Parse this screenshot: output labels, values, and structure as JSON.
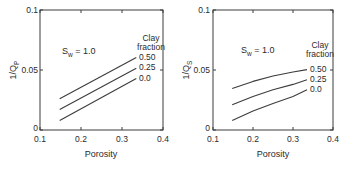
{
  "figure": {
    "background": "#ffffff",
    "line_color": "#3c3c3c",
    "text_color": "#2b2b2b"
  },
  "chart_data": [
    {
      "type": "line",
      "panel": "left",
      "xlabel": "Porosity",
      "ylabel_base": "1/Q",
      "ylabel_sub": "P",
      "annotation_base": "S",
      "annotation_sub": "w",
      "annotation_rest": " = 1.0",
      "legend_title_lines": [
        "Clay",
        "fraction"
      ],
      "legend_position": "inside-top-right",
      "grid": false,
      "xlim": [
        0.1,
        0.4
      ],
      "ylim": [
        0,
        0.1
      ],
      "x_ticks": [
        {
          "v": 0.1,
          "label": "0.1"
        },
        {
          "v": 0.2,
          "label": "0.2"
        },
        {
          "v": 0.3,
          "label": "0.3"
        },
        {
          "v": 0.4,
          "label": "0.4"
        }
      ],
      "y_ticks": [
        {
          "v": 0.1,
          "label": "0.1"
        },
        {
          "v": 0.05,
          "label": "0.05"
        },
        {
          "v": 0,
          "label": "0"
        }
      ],
      "series": [
        {
          "name": "clay-0.50",
          "label": "0.50",
          "x": [
            0.148,
            0.335
          ],
          "y": [
            0.026,
            0.0605
          ]
        },
        {
          "name": "clay-0.25",
          "label": "0.25",
          "x": [
            0.148,
            0.335
          ],
          "y": [
            0.017,
            0.0515
          ]
        },
        {
          "name": "clay-0.0",
          "label": "0.0",
          "x": [
            0.148,
            0.335
          ],
          "y": [
            0.008,
            0.0428
          ]
        }
      ]
    },
    {
      "type": "line",
      "panel": "right",
      "xlabel": "Porosity",
      "ylabel_base": "1/Q",
      "ylabel_sub": "S",
      "annotation_base": "S",
      "annotation_sub": "w",
      "annotation_rest": " = 1.0",
      "legend_title_lines": [
        "Clay",
        "fraction"
      ],
      "legend_position": "inside-top-right",
      "grid": false,
      "xlim": [
        0.1,
        0.4
      ],
      "ylim": [
        0,
        0.1
      ],
      "x_ticks": [
        {
          "v": 0.1,
          "label": "0.1"
        },
        {
          "v": 0.2,
          "label": "0.2"
        },
        {
          "v": 0.3,
          "label": "0.3"
        },
        {
          "v": 0.4,
          "label": "0.4"
        }
      ],
      "y_ticks": [
        {
          "v": 0.1,
          "label": "0.1"
        },
        {
          "v": 0.05,
          "label": "0.05"
        },
        {
          "v": 0,
          "label": "0"
        }
      ],
      "series": [
        {
          "name": "clay-0.50",
          "label": "0.50",
          "x": [
            0.148,
            0.2,
            0.25,
            0.3,
            0.335
          ],
          "y": [
            0.0345,
            0.0405,
            0.045,
            0.0483,
            0.0503
          ]
        },
        {
          "name": "clay-0.25",
          "label": "0.25",
          "x": [
            0.148,
            0.2,
            0.25,
            0.3,
            0.335
          ],
          "y": [
            0.021,
            0.028,
            0.0335,
            0.038,
            0.0419
          ]
        },
        {
          "name": "clay-0.0",
          "label": "0.0",
          "x": [
            0.148,
            0.2,
            0.25,
            0.3,
            0.335
          ],
          "y": [
            0.0078,
            0.0158,
            0.0222,
            0.028,
            0.0335
          ]
        }
      ]
    }
  ]
}
